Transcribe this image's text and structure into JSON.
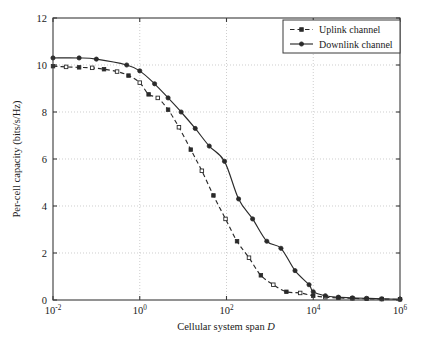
{
  "chart_data": {
    "type": "line",
    "title": "",
    "xlabel": "Cellular system span D",
    "xlabel_plain": "Cellular system span",
    "xlabel_italic_symbol": "D",
    "ylabel": "Per-cell capacity (bits/s/Hz)",
    "xscale": "log",
    "yscale": "linear",
    "xlim": [
      0.01,
      1000000
    ],
    "ylim": [
      0,
      12
    ],
    "xticks": [
      0.01,
      1,
      100,
      10000,
      1000000
    ],
    "xtick_labels": [
      "10^-2",
      "10^0",
      "10^2",
      "10^4",
      "10^6"
    ],
    "xtick_mantissa": [
      "10",
      "10",
      "10",
      "10",
      "10"
    ],
    "xtick_exponents": [
      "-2",
      "0",
      "2",
      "4",
      "6"
    ],
    "yticks": [
      0,
      2,
      4,
      6,
      8,
      10,
      12
    ],
    "ytick_labels": [
      "0",
      "2",
      "4",
      "6",
      "8",
      "10",
      "12"
    ],
    "grid": true,
    "grid_style": "dotted",
    "grid_color": "#b9b9b9",
    "legend_position": "top-right",
    "series": [
      {
        "name": "Uplink channel",
        "marker": "square",
        "linestyle": "dashed",
        "color": "#2a2a2a",
        "x": [
          0.01,
          0.02,
          0.04,
          0.08,
          0.15,
          0.3,
          0.55,
          1.0,
          1.6,
          2.6,
          4.5,
          8.0,
          15.0,
          27.0,
          50.0,
          95.0,
          175.0,
          330.0,
          620.0,
          1200.0,
          2400.0,
          5000.0,
          10000.0,
          19000.0,
          38000.0,
          80000.0,
          170000.0,
          380000.0,
          1000000.0
        ],
        "y": [
          9.95,
          9.92,
          9.9,
          9.88,
          9.82,
          9.72,
          9.55,
          9.25,
          8.75,
          8.6,
          8.1,
          7.35,
          6.4,
          5.5,
          4.45,
          3.45,
          2.5,
          1.8,
          1.05,
          0.65,
          0.35,
          0.3,
          0.18,
          0.12,
          0.09,
          0.07,
          0.05,
          0.04,
          0.03
        ]
      },
      {
        "name": "Downlink channel",
        "marker": "circle",
        "linestyle": "solid",
        "color": "#2a2a2a",
        "x": [
          0.01,
          0.04,
          0.1,
          0.5,
          1.0,
          2.2,
          4.5,
          9.0,
          19.0,
          40.0,
          90.0,
          190.0,
          400.0,
          850.0,
          1800.0,
          3800.0,
          8000.0,
          10000.0,
          19000.0,
          38000.0,
          80000.0,
          170000.0,
          380000.0,
          1000000.0
        ],
        "y": [
          10.3,
          10.3,
          10.25,
          10.0,
          9.75,
          9.2,
          8.6,
          8.0,
          7.3,
          6.55,
          5.9,
          4.3,
          3.45,
          2.5,
          2.2,
          1.25,
          0.65,
          0.35,
          0.18,
          0.12,
          0.09,
          0.07,
          0.05,
          0.03
        ]
      }
    ]
  },
  "legend": {
    "entries": [
      {
        "label": "Uplink channel",
        "marker": "square",
        "linestyle": "dashed"
      },
      {
        "label": "Downlink channel",
        "marker": "circle",
        "linestyle": "solid"
      }
    ]
  },
  "axes": {
    "y_axis_title": "Per-cell capacity (bits/s/Hz)",
    "x_axis_title_plain": "Cellular system span",
    "x_axis_title_symbol": "D"
  }
}
